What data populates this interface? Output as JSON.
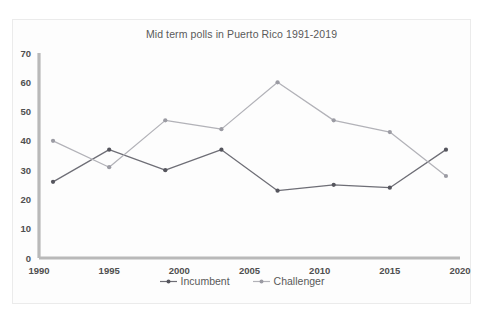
{
  "chart_data": {
    "type": "line",
    "title": "Mid term polls in Puerto Rico 1991-2019",
    "xlabel": "",
    "ylabel": "",
    "xlim": [
      1990,
      2020
    ],
    "ylim": [
      0,
      70
    ],
    "xticks": [
      "1990",
      "1995",
      "2000",
      "2005",
      "2010",
      "2015",
      "2020"
    ],
    "yticks": [
      "0",
      "10",
      "20",
      "30",
      "40",
      "50",
      "60",
      "70"
    ],
    "grid": false,
    "legend_position": "bottom",
    "x": [
      1991,
      1995,
      1999,
      2003,
      2007,
      2011,
      2015,
      2019
    ],
    "series": [
      {
        "name": "Incumbent",
        "color": "#55555d",
        "values": [
          26,
          37,
          30,
          37,
          23,
          25,
          24,
          37
        ]
      },
      {
        "name": "Challenger",
        "color": "#9b9ba3",
        "values": [
          40,
          31,
          47,
          44,
          60,
          47,
          43,
          28
        ]
      }
    ]
  },
  "legend": {
    "items": [
      {
        "label": "Incumbent"
      },
      {
        "label": "Challenger"
      }
    ]
  }
}
